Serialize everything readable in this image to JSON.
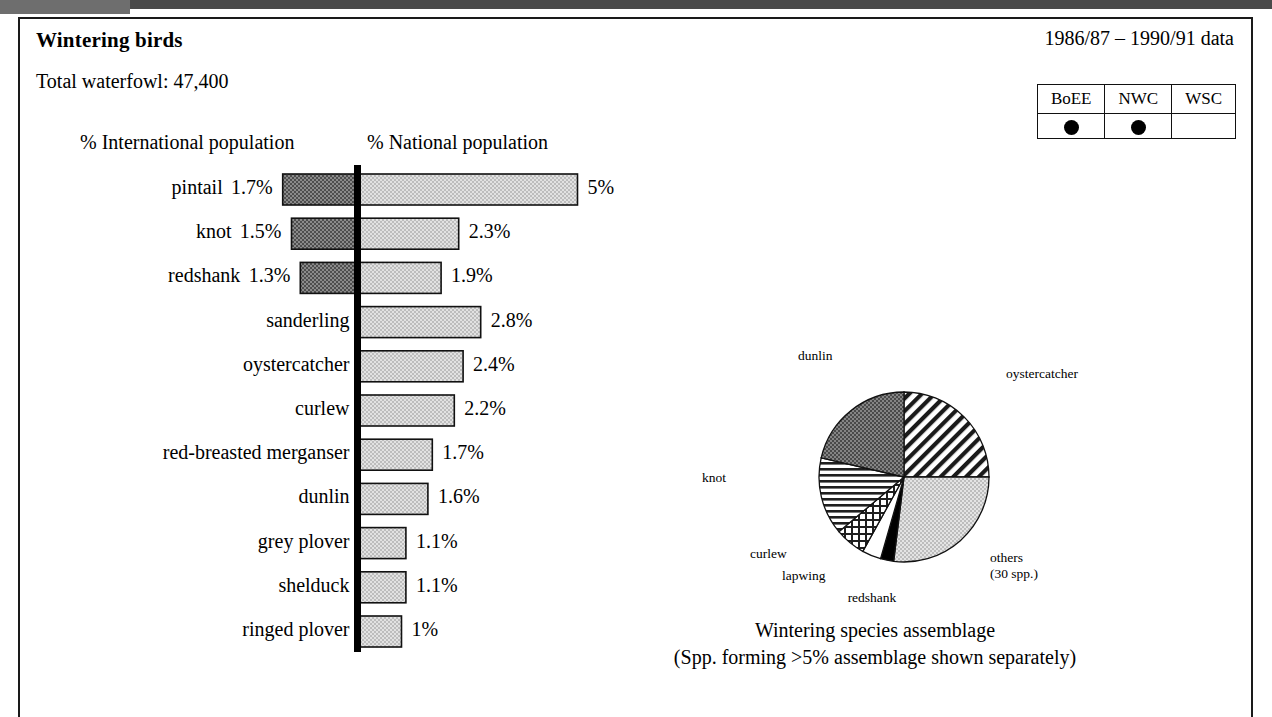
{
  "header": {
    "title": "Wintering birds",
    "total_waterfowl": "Total waterfowl: 47,400",
    "date_range": "1986/87 – 1990/91 data"
  },
  "designation_table": {
    "columns": [
      "BoEE",
      "NWC",
      "WSC"
    ],
    "marked": [
      true,
      true,
      false
    ]
  },
  "chart_data": [
    {
      "type": "bar",
      "orientation": "horizontal-bidirectional",
      "title": "",
      "left_axis_label": "% International population",
      "right_axis_label": "% National population",
      "xlabel": "",
      "ylabel": "",
      "scale_px_per_percent": 44,
      "categories": [
        "pintail",
        "knot",
        "redshank",
        "sanderling",
        "oystercatcher",
        "curlew",
        "red-breasted merganser",
        "dunlin",
        "grey plover",
        "shelduck",
        "ringed plover"
      ],
      "series": [
        {
          "name": "% International population",
          "side": "left",
          "values": [
            1.7,
            1.5,
            1.3,
            null,
            null,
            null,
            null,
            null,
            null,
            null,
            null
          ],
          "labels": [
            "1.7%",
            "1.5%",
            "1.3%",
            "",
            "",
            "",
            "",
            "",
            "",
            "",
            ""
          ]
        },
        {
          "name": "% National population",
          "side": "right",
          "values": [
            5,
            2.3,
            1.9,
            2.8,
            2.4,
            2.2,
            1.7,
            1.6,
            1.1,
            1.1,
            1
          ],
          "labels": [
            "5%",
            "2.3%",
            "1.9%",
            "2.8%",
            "2.4%",
            "2.2%",
            "1.7%",
            "1.6%",
            "1.1%",
            "1.1%",
            "1%"
          ]
        }
      ]
    },
    {
      "type": "pie",
      "title": "Wintering species assemblage",
      "subtitle": "(Spp. forming >5% assemblage shown separately)",
      "labels": [
        "oystercatcher",
        "others (30 spp.)",
        "redshank",
        "lapwing",
        "curlew",
        "knot",
        "dunlin"
      ],
      "label_lines": [
        [
          "oystercatcher"
        ],
        [
          "others",
          "(30 spp.)"
        ],
        [
          "redshank"
        ],
        [
          "lapwing"
        ],
        [
          "curlew"
        ],
        [
          "knot"
        ],
        [
          "dunlin"
        ]
      ],
      "values": [
        25,
        27,
        2.5,
        3.5,
        8,
        12,
        22
      ],
      "start_angles_deg": [
        0,
        90,
        187,
        196,
        209,
        230,
        283
      ],
      "end_angles_deg": [
        90,
        187,
        196,
        209,
        230,
        283,
        360
      ],
      "fills": [
        "diagonal-hatch",
        "light-dither",
        "solid-black",
        "white",
        "cross-hatch",
        "horizontal-lines",
        "dark-dither"
      ]
    }
  ],
  "pie_caption_line1": "Wintering species assemblage",
  "pie_caption_line2": "(Spp. forming >5% assemblage shown separately)"
}
